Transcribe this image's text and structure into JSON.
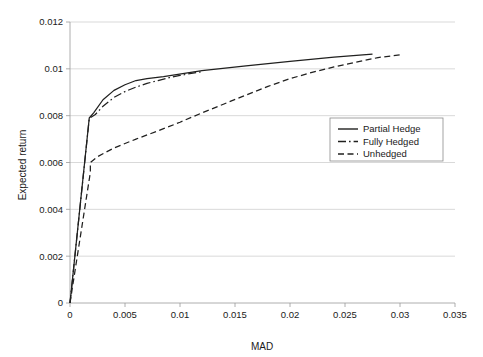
{
  "chart_data": {
    "type": "line",
    "title": "",
    "xlabel": "MAD",
    "ylabel": "Expected return",
    "xlim": [
      0,
      0.035
    ],
    "ylim": [
      0,
      0.012
    ],
    "xticks": [
      "0",
      "0.005",
      "0.01",
      "0.015",
      "0.02",
      "0.025",
      "0.03",
      "0.035"
    ],
    "xtick_values": [
      0,
      0.005,
      0.01,
      0.015,
      0.02,
      0.025,
      0.03,
      0.035
    ],
    "yticks": [
      "0",
      "0.002",
      "0.004",
      "0.006",
      "0.008",
      "0.01",
      "0.012"
    ],
    "ytick_values": [
      0,
      0.002,
      0.004,
      0.006,
      0.008,
      0.01,
      0.012
    ],
    "grid": "horizontal",
    "legend_position": "right-middle",
    "series": [
      {
        "name": "Partial Hedge",
        "style": "solid",
        "points": [
          [
            0.0,
            0.0
          ],
          [
            0.00175,
            0.0079
          ],
          [
            0.00215,
            0.00812
          ],
          [
            0.003,
            0.00868
          ],
          [
            0.004,
            0.00908
          ],
          [
            0.005,
            0.00932
          ],
          [
            0.006,
            0.0095
          ],
          [
            0.007,
            0.00958
          ],
          [
            0.0085,
            0.00967
          ],
          [
            0.012,
            0.00992
          ],
          [
            0.016,
            0.01013
          ],
          [
            0.02,
            0.01032
          ],
          [
            0.024,
            0.0105
          ],
          [
            0.0275,
            0.01063
          ]
        ]
      },
      {
        "name": "Fully Hedged",
        "style": "dashdot",
        "points": [
          [
            0.0,
            0.0
          ],
          [
            0.00175,
            0.00788
          ],
          [
            0.0023,
            0.00805
          ],
          [
            0.003,
            0.0084
          ],
          [
            0.004,
            0.00878
          ],
          [
            0.005,
            0.00903
          ],
          [
            0.006,
            0.00922
          ],
          [
            0.007,
            0.00938
          ],
          [
            0.008,
            0.0095
          ],
          [
            0.009,
            0.00962
          ],
          [
            0.01,
            0.00972
          ],
          [
            0.012,
            0.00988
          ]
        ]
      },
      {
        "name": "Unhedged",
        "style": "dashed",
        "points": [
          [
            0.0,
            0.0
          ],
          [
            0.00185,
            0.00558
          ],
          [
            0.00185,
            0.006
          ],
          [
            0.0025,
            0.00625
          ],
          [
            0.004,
            0.00662
          ],
          [
            0.006,
            0.007
          ],
          [
            0.008,
            0.00735
          ],
          [
            0.01,
            0.00772
          ],
          [
            0.012,
            0.00812
          ],
          [
            0.014,
            0.0085
          ],
          [
            0.016,
            0.00888
          ],
          [
            0.018,
            0.00925
          ],
          [
            0.02,
            0.00958
          ],
          [
            0.022,
            0.00985
          ],
          [
            0.024,
            0.01008
          ],
          [
            0.026,
            0.01028
          ],
          [
            0.028,
            0.01048
          ],
          [
            0.03,
            0.0106
          ]
        ]
      }
    ],
    "legend_entries": [
      {
        "label": "Partial Hedge",
        "style": "solid"
      },
      {
        "label": "Fully Hedged",
        "style": "dashdot"
      },
      {
        "label": "Unhedged",
        "style": "dashed"
      }
    ]
  },
  "colors": {
    "line": "#20201f",
    "grid": "#c8c8c8",
    "axis": "#9a9a9a",
    "background": "#ffffff"
  }
}
